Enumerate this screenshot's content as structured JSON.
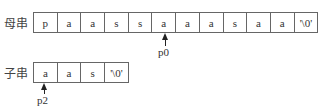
{
  "main_string": {
    "label": "母串",
    "cells": [
      "p",
      "a",
      "a",
      "s",
      "s",
      "a",
      "a",
      "a",
      "s",
      "a",
      "a",
      "'\\0'"
    ],
    "pointer": {
      "label": "p0",
      "index": 5
    }
  },
  "sub_string": {
    "label": "子串",
    "cells": [
      "a",
      "a",
      "s",
      "'\\0'"
    ],
    "pointer": {
      "label": "p2",
      "index": 0
    }
  }
}
